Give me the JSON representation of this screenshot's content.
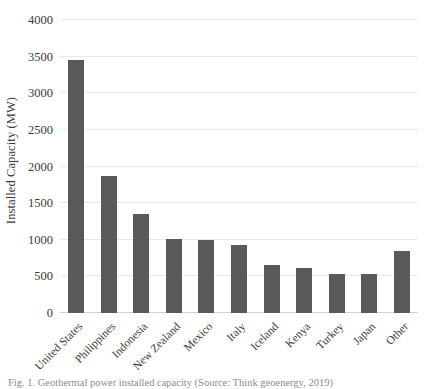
{
  "chart_data": {
    "type": "bar",
    "title": "",
    "xlabel": "",
    "ylabel": "Installed Capacity (MW)",
    "ylim": [
      0,
      4000
    ],
    "yticks": [
      0,
      500,
      1000,
      1500,
      2000,
      2500,
      3000,
      3500,
      4000
    ],
    "ytick_labels": [
      "0",
      "500",
      "1000",
      "1500",
      "2000",
      "2500",
      "3000",
      "3500",
      "4000"
    ],
    "grid": true,
    "legend": "none",
    "bar_color": "#595959",
    "gridline_color": "#e8e8e8",
    "axis_color": "#d2d2d2",
    "categories": [
      "United States",
      "Philippines",
      "Indonesia",
      "New Zealand",
      "Mexico",
      "Italy",
      "Iceland",
      "Kenya",
      "Turkey",
      "Japan",
      "Other"
    ],
    "values": [
      3450,
      1870,
      1345,
      1005,
      995,
      930,
      660,
      620,
      535,
      530,
      845
    ]
  },
  "caption": {
    "text": "Fig. 1. Geothermal power installed capacity (Source: Think geoenergy, 2019)"
  }
}
